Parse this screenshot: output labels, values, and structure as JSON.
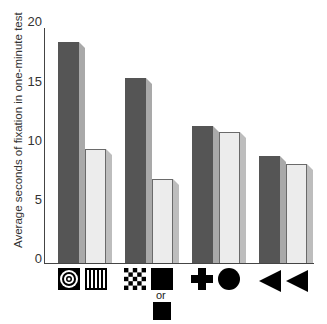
{
  "chart_data": {
    "type": "bar",
    "title": "",
    "xlabel": "",
    "ylabel": "Average seconds of fixation in one-minute test",
    "ylim": [
      0,
      20
    ],
    "yticks": [
      0,
      5,
      10,
      15,
      20
    ],
    "grid": false,
    "legend": null,
    "categories": [
      "bullseye vs. vertical stripes",
      "checkerboard vs. solid square (or smaller solid square)",
      "cross vs. circle",
      "triangle vs. triangle"
    ],
    "category_icons": [
      [
        "concentric-circles-icon",
        "vertical-stripes-icon"
      ],
      [
        "checkerboard-icon",
        "solid-square-icon"
      ],
      [
        "cross-icon",
        "solid-circle-icon"
      ],
      [
        "left-triangle-icon",
        "left-triangle-icon"
      ]
    ],
    "series": [
      {
        "name": "first stimulus",
        "color": "#555555",
        "values": [
          18.7,
          15.7,
          11.6,
          9.1
        ]
      },
      {
        "name": "second stimulus",
        "color": "#ececec",
        "values": [
          9.7,
          7.1,
          11.1,
          8.4
        ]
      }
    ],
    "annotations": [
      "or"
    ]
  },
  "axis": {
    "ylabel": "Average seconds of fixation in one-minute test",
    "ticks": [
      "0",
      "5",
      "10",
      "15",
      "20"
    ]
  },
  "labels": {
    "or": "or"
  }
}
